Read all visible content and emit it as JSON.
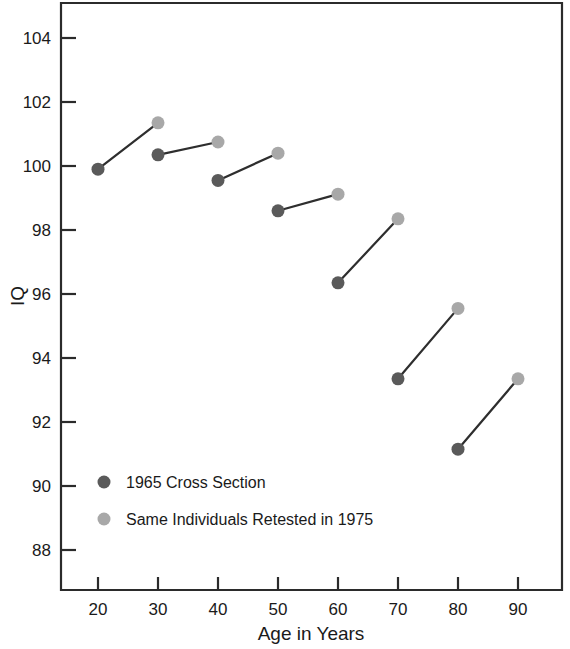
{
  "chart_data": {
    "type": "scatter",
    "title": "",
    "subtitle": "",
    "xlabel": "Age in Years",
    "ylabel": "IQ",
    "xlim": [
      15,
      95
    ],
    "ylim": [
      87,
      105
    ],
    "grid": false,
    "legend_position": "inside-lower-left",
    "x": [
      20,
      30,
      40,
      50,
      60,
      70,
      80,
      90
    ],
    "xticks": [
      "20",
      "30",
      "40",
      "50",
      "60",
      "70",
      "80",
      "90"
    ],
    "yticks": [
      "104",
      "102",
      "100",
      "98",
      "96",
      "94",
      "92",
      "90",
      "88"
    ],
    "series": [
      {
        "name": "1965 Cross Section",
        "color": "#5a5a5a",
        "x": [
          20,
          30,
          40,
          50,
          60,
          70,
          80
        ],
        "values": [
          99.9,
          100.35,
          99.55,
          98.6,
          96.35,
          93.35,
          91.15
        ]
      },
      {
        "name": "Same Individuals Retested in 1975",
        "color": "#a8a8a8",
        "x": [
          30,
          40,
          50,
          60,
          70,
          80,
          90
        ],
        "values": [
          101.35,
          100.75,
          100.4,
          99.12,
          98.35,
          95.55,
          93.35
        ]
      }
    ],
    "connectors": [
      {
        "x1": 20,
        "y1": 99.9,
        "x2": 30,
        "y2": 101.35
      },
      {
        "x1": 30,
        "y1": 100.35,
        "x2": 40,
        "y2": 100.75
      },
      {
        "x1": 40,
        "y1": 99.55,
        "x2": 50,
        "y2": 100.4
      },
      {
        "x1": 50,
        "y1": 98.6,
        "x2": 60,
        "y2": 99.12
      },
      {
        "x1": 60,
        "y1": 96.35,
        "x2": 70,
        "y2": 98.35
      },
      {
        "x1": 70,
        "y1": 93.35,
        "x2": 80,
        "y2": 95.55
      },
      {
        "x1": 80,
        "y1": 91.15,
        "x2": 90,
        "y2": 93.35
      }
    ],
    "annotations": []
  },
  "legend": {
    "entries": [
      {
        "label": "1965 Cross Section",
        "color": "#5a5a5a"
      },
      {
        "label": "Same Individuals Retested in 1975",
        "color": "#a8a8a8"
      }
    ]
  },
  "axes": {
    "x_title": "Age in Years",
    "y_title": "IQ"
  },
  "colors": {
    "frame": "#2b2b2b",
    "series_1965": "#5a5a5a",
    "series_1975": "#a8a8a8",
    "background": "#ffffff",
    "text": "#1a1a1a"
  }
}
